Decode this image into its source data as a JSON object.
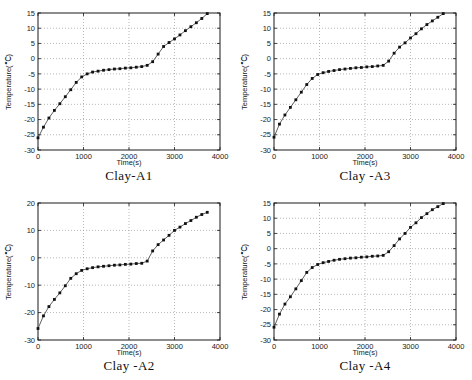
{
  "page": {
    "background": "#ffffff"
  },
  "colors": {
    "line": "#4d4d4d",
    "marker": "#111111",
    "grid": "#9a9a9a",
    "box": "#1a1a1a",
    "text": "#1a1a1a"
  },
  "chart_data": [
    {
      "type": "line",
      "title": "Clay-A1",
      "xlabel": "Time(s)",
      "ylabel": "Temperature(℃)",
      "xlim": [
        0,
        4000
      ],
      "ylim": [
        -30,
        15
      ],
      "xticks": [
        0,
        1000,
        2000,
        3000,
        4000
      ],
      "yticks": [
        -30,
        -25,
        -20,
        -15,
        -10,
        -5,
        0,
        5,
        10,
        15
      ],
      "grid": true,
      "legend": "none",
      "marker": "square",
      "x": [
        0,
        120,
        240,
        360,
        480,
        600,
        720,
        840,
        960,
        1080,
        1200,
        1320,
        1440,
        1560,
        1680,
        1800,
        1920,
        2040,
        2160,
        2280,
        2400,
        2520,
        2640,
        2760,
        2880,
        3000,
        3120,
        3240,
        3360,
        3480,
        3600,
        3720
      ],
      "y": [
        -26,
        -22.5,
        -19.5,
        -17,
        -14.8,
        -12.5,
        -10.2,
        -7.8,
        -6,
        -5,
        -4.4,
        -4.1,
        -3.8,
        -3.6,
        -3.4,
        -3.3,
        -3.1,
        -3,
        -2.8,
        -2.6,
        -2.2,
        -1,
        1.5,
        4,
        5.3,
        6.5,
        7.8,
        9.2,
        10.5,
        11.8,
        13.2,
        14.8
      ]
    },
    {
      "type": "line",
      "title": "Clay -A3",
      "xlabel": "Time(s)",
      "ylabel": "Temperature(℃)",
      "xlim": [
        0,
        4000
      ],
      "ylim": [
        -30,
        15
      ],
      "xticks": [
        0,
        1000,
        2000,
        3000,
        4000
      ],
      "yticks": [
        -30,
        -25,
        -20,
        -15,
        -10,
        -5,
        0,
        5,
        10,
        15
      ],
      "grid": true,
      "legend": "none",
      "marker": "square",
      "x": [
        0,
        120,
        240,
        360,
        480,
        600,
        720,
        840,
        960,
        1080,
        1200,
        1320,
        1440,
        1560,
        1680,
        1800,
        1920,
        2040,
        2160,
        2280,
        2400,
        2520,
        2640,
        2760,
        2880,
        3000,
        3120,
        3240,
        3360,
        3480,
        3600,
        3720
      ],
      "y": [
        -25.8,
        -21.5,
        -18.5,
        -16,
        -13.5,
        -11,
        -8.5,
        -6.5,
        -5.2,
        -4.6,
        -4.2,
        -3.9,
        -3.6,
        -3.4,
        -3.2,
        -3,
        -2.9,
        -2.7,
        -2.6,
        -2.4,
        -2.2,
        -0.8,
        1.8,
        3.8,
        5.2,
        6.8,
        8.2,
        9.8,
        11.2,
        12.4,
        13.6,
        14.8
      ]
    },
    {
      "type": "line",
      "title": "Clay -A2",
      "xlabel": "Time(s)",
      "ylabel": "Temperature(℃)",
      "xlim": [
        0,
        4000
      ],
      "ylim": [
        -30,
        20
      ],
      "xticks": [
        0,
        1000,
        2000,
        3000,
        4000
      ],
      "yticks": [
        -30,
        -20,
        -10,
        0,
        10,
        20
      ],
      "grid": true,
      "legend": "none",
      "marker": "square",
      "x": [
        0,
        120,
        240,
        360,
        480,
        600,
        720,
        840,
        960,
        1080,
        1200,
        1320,
        1440,
        1560,
        1680,
        1800,
        1920,
        2040,
        2160,
        2280,
        2400,
        2520,
        2640,
        2760,
        2880,
        3000,
        3120,
        3240,
        3360,
        3480,
        3600,
        3720
      ],
      "y": [
        -25.8,
        -21.2,
        -17.8,
        -15.2,
        -12.8,
        -10.2,
        -7.5,
        -5.8,
        -4.6,
        -4,
        -3.6,
        -3.3,
        -3.1,
        -2.9,
        -2.7,
        -2.6,
        -2.4,
        -2.3,
        -2.1,
        -2,
        -1.2,
        2.5,
        4.8,
        6.5,
        8.2,
        10,
        11.2,
        12.5,
        13.6,
        14.8,
        15.8,
        16.6
      ]
    },
    {
      "type": "line",
      "title": "Clay -A4",
      "xlabel": "Time(s)",
      "ylabel": "Temperature(℃)",
      "xlim": [
        0,
        4000
      ],
      "ylim": [
        -30,
        15
      ],
      "xticks": [
        0,
        1000,
        2000,
        3000,
        4000
      ],
      "yticks": [
        -30,
        -25,
        -20,
        -15,
        -10,
        -5,
        0,
        5,
        10,
        15
      ],
      "grid": true,
      "legend": "none",
      "marker": "square",
      "x": [
        0,
        120,
        240,
        360,
        480,
        600,
        720,
        840,
        960,
        1080,
        1200,
        1320,
        1440,
        1560,
        1680,
        1800,
        1920,
        2040,
        2160,
        2280,
        2400,
        2520,
        2640,
        2760,
        2880,
        3000,
        3120,
        3240,
        3360,
        3480,
        3600,
        3720
      ],
      "y": [
        -25.8,
        -21.5,
        -18.2,
        -15.8,
        -13.2,
        -10.5,
        -7.8,
        -6.2,
        -5.2,
        -4.6,
        -4.2,
        -3.8,
        -3.5,
        -3.3,
        -3.1,
        -3,
        -2.8,
        -2.7,
        -2.5,
        -2.4,
        -2.2,
        -1,
        1,
        3.2,
        5,
        7,
        8.5,
        10.2,
        11.5,
        12.8,
        13.8,
        14.8
      ]
    }
  ]
}
